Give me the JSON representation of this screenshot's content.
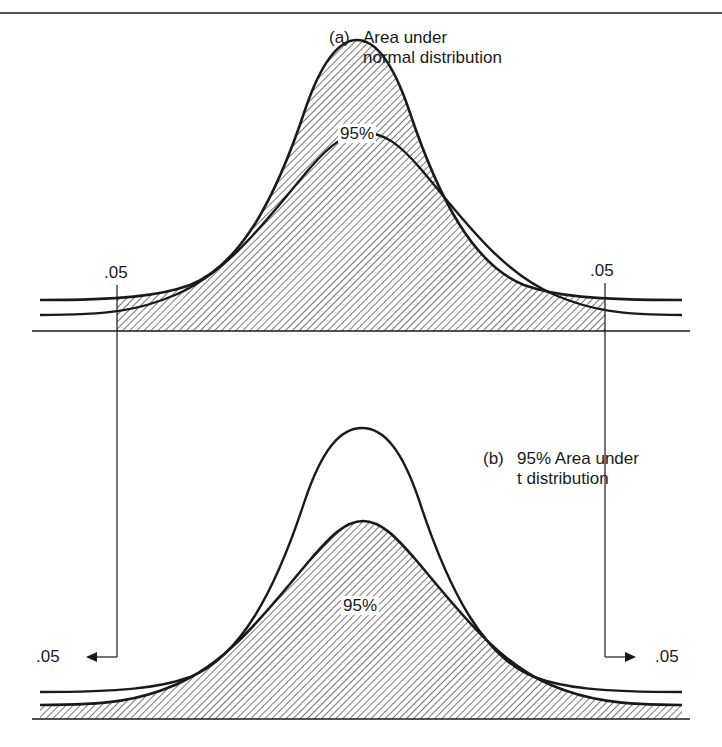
{
  "figure": {
    "panel_a": {
      "tag": "(a)",
      "caption_line1": "Area under",
      "caption_line2": "normal distribution",
      "center_label": "95%",
      "left_tail_label": ".05",
      "right_tail_label": ".05"
    },
    "panel_b": {
      "tag": "(b)",
      "caption_line1": "95% Area under",
      "caption_line2": "t distribution",
      "center_label": "95%",
      "left_tail_label": ".05",
      "right_tail_label": ".05"
    }
  },
  "colors": {
    "ink": "#1a1a1a",
    "background": "#ffffff"
  }
}
